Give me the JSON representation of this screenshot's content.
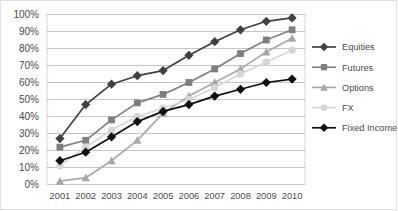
{
  "chart_data": {
    "type": "line",
    "title": "",
    "subtitle": "",
    "xlabel": "",
    "ylabel": "",
    "grid": true,
    "grid_axis": "y",
    "legend_position": "right",
    "categories": [
      "2001",
      "2002",
      "2003",
      "2004",
      "2005",
      "2006",
      "2007",
      "2008",
      "2009",
      "2010"
    ],
    "ylim": [
      0,
      100
    ],
    "ytick_values": [
      0,
      10,
      20,
      30,
      40,
      50,
      60,
      70,
      80,
      90,
      100
    ],
    "ytick_labels": [
      "0%",
      "10%",
      "20%",
      "30%",
      "40%",
      "50%",
      "60%",
      "70%",
      "80%",
      "90%",
      "100%"
    ],
    "series": [
      {
        "name": "Equities",
        "color": "#414141",
        "marker": "diamond",
        "values": [
          27,
          47,
          59,
          64,
          67,
          76,
          84,
          91,
          96,
          98
        ]
      },
      {
        "name": "Futures",
        "color": "#7f7f7f",
        "marker": "square",
        "values": [
          22,
          26,
          38,
          48,
          53,
          60,
          68,
          77,
          85,
          91
        ]
      },
      {
        "name": "Options",
        "color": "#a8a8a8",
        "marker": "triangle",
        "values": [
          2,
          4,
          14,
          26,
          42,
          52,
          60,
          68,
          78,
          86
        ]
      },
      {
        "name": "FX",
        "color": "#d6d6d6",
        "marker": "circle",
        "values": [
          11,
          22,
          32,
          40,
          45,
          50,
          57,
          65,
          72,
          79
        ]
      },
      {
        "name": "Fixed Income",
        "color": "#111111",
        "marker": "diamond",
        "values": [
          14,
          19,
          28,
          37,
          43,
          47,
          52,
          56,
          60,
          62
        ]
      }
    ]
  },
  "layout": {
    "plot_left": 46,
    "plot_right": 304,
    "plot_top": 13.5,
    "plot_bottom": 183.5,
    "legend_x": 311,
    "legend_top": 46,
    "legend_row_height": 20.2,
    "legend_sample_width": 24,
    "legend_text_gap": 6
  }
}
